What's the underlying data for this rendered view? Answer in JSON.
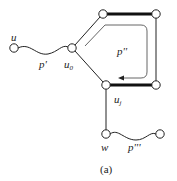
{
  "diagram": {
    "caption": "(a)",
    "colors": {
      "stroke": "#222222",
      "node_fill": "#ffffff",
      "path_arrow": "#555555"
    },
    "nodes": [
      {
        "id": "u",
        "label": "u",
        "x": 14,
        "y": 48
      },
      {
        "id": "u0",
        "label": "u",
        "sub": "0",
        "x": 72,
        "y": 48
      },
      {
        "id": "tl",
        "label": "",
        "x": 103,
        "y": 14
      },
      {
        "id": "tr",
        "label": "",
        "x": 156,
        "y": 14
      },
      {
        "id": "uj",
        "label": "u",
        "sub": "j",
        "x": 106,
        "y": 85
      },
      {
        "id": "br",
        "label": "",
        "x": 156,
        "y": 85
      },
      {
        "id": "w",
        "label": "w",
        "x": 106,
        "y": 134
      },
      {
        "id": "wr",
        "label": "",
        "x": 160,
        "y": 134
      }
    ],
    "edges": [
      {
        "from": "u",
        "to": "u0",
        "style": "wavy",
        "label": "p'"
      },
      {
        "from": "u0",
        "to": "tl",
        "style": "thin"
      },
      {
        "from": "tl",
        "to": "tr",
        "style": "thick"
      },
      {
        "from": "tr",
        "to": "br",
        "style": "thin"
      },
      {
        "from": "br",
        "to": "uj",
        "style": "thick"
      },
      {
        "from": "uj",
        "to": "u0",
        "style": "thin"
      },
      {
        "from": "uj",
        "to": "w",
        "style": "thin"
      },
      {
        "from": "w",
        "to": "wr",
        "style": "wavy",
        "label": "p'''"
      }
    ],
    "path_labels": {
      "p1": "p'",
      "p2": "p''",
      "p3": "p'''"
    },
    "node_labels": {
      "u": "u",
      "u0_base": "u",
      "u0_sub": "0",
      "uj_base": "u",
      "uj_sub": "j",
      "w": "w"
    }
  }
}
